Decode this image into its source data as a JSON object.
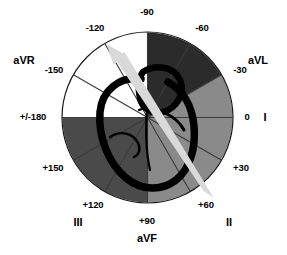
{
  "figure": {
    "type": "polar-diagram",
    "circle": {
      "cx": 147.5,
      "cy": 117.5,
      "r": 85
    },
    "colors": {
      "background": "#ffffff",
      "sector_white": "#ffffff",
      "sector_mid_gray": "#8a8a8a",
      "sector_dark_gray": "#4a4a4a",
      "sector_darkest": "#2b2b2b",
      "outline": "#000000",
      "heart_outline": "#000000",
      "arrow": "#d9d9d9",
      "spoke": "#3a3a3a"
    },
    "sectors": [
      {
        "name": "sector--90-to--60",
        "start_deg": -90,
        "end_deg": -60,
        "fill": "#2b2b2b"
      },
      {
        "name": "sector--60-to--30",
        "start_deg": -60,
        "end_deg": -30,
        "fill": "#2b2b2b"
      },
      {
        "name": "sector--30-to-0",
        "start_deg": -30,
        "end_deg": 0,
        "fill": "#8a8a8a"
      },
      {
        "name": "sector-0-to-30",
        "start_deg": 0,
        "end_deg": 30,
        "fill": "#8a8a8a"
      },
      {
        "name": "sector-30-to-60",
        "start_deg": 30,
        "end_deg": 60,
        "fill": "#8a8a8a"
      },
      {
        "name": "sector-60-to-90",
        "start_deg": 60,
        "end_deg": 90,
        "fill": "#8a8a8a"
      },
      {
        "name": "sector-90-to-120",
        "start_deg": 90,
        "end_deg": 120,
        "fill": "#4a4a4a"
      },
      {
        "name": "sector-120-to-150",
        "start_deg": 120,
        "end_deg": 150,
        "fill": "#4a4a4a"
      },
      {
        "name": "sector-150-to-180",
        "start_deg": 150,
        "end_deg": 180,
        "fill": "#4a4a4a"
      },
      {
        "name": "sector--180-to--150",
        "start_deg": 180,
        "end_deg": 210,
        "fill": "#ffffff"
      },
      {
        "name": "sector--150-to--120",
        "start_deg": 210,
        "end_deg": 240,
        "fill": "#ffffff"
      },
      {
        "name": "sector--120-to--90",
        "start_deg": 240,
        "end_deg": 270,
        "fill": "#ffffff"
      }
    ],
    "axis_labels": [
      {
        "id": "deg-minus-90",
        "text": "-90",
        "x": 147,
        "y": 12,
        "anchor": "center"
      },
      {
        "id": "deg-minus-120",
        "text": "-120",
        "x": 95,
        "y": 28,
        "anchor": "center"
      },
      {
        "id": "deg-minus-150",
        "text": "-150",
        "x": 54,
        "y": 70,
        "anchor": "center"
      },
      {
        "id": "deg-plus-minus-180",
        "text": "+/-180",
        "x": 33,
        "y": 117,
        "anchor": "center"
      },
      {
        "id": "deg-plus-150",
        "text": "+150",
        "x": 53,
        "y": 168,
        "anchor": "center"
      },
      {
        "id": "deg-plus-120",
        "text": "+120",
        "x": 93,
        "y": 205,
        "anchor": "center"
      },
      {
        "id": "deg-plus-90",
        "text": "+90",
        "x": 147,
        "y": 221,
        "anchor": "center"
      },
      {
        "id": "deg-plus-60",
        "text": "+60",
        "x": 206,
        "y": 205,
        "anchor": "center"
      },
      {
        "id": "deg-plus-30",
        "text": "+30",
        "x": 241,
        "y": 168,
        "anchor": "center"
      },
      {
        "id": "deg-zero",
        "text": "0",
        "x": 247,
        "y": 117,
        "anchor": "center"
      },
      {
        "id": "deg-minus-30",
        "text": "-30",
        "x": 240,
        "y": 70,
        "anchor": "center"
      },
      {
        "id": "deg-minus-60",
        "text": "-60",
        "x": 202,
        "y": 28,
        "anchor": "center"
      }
    ],
    "lead_labels": [
      {
        "id": "lead-aVR",
        "text": "aVR",
        "x": 24,
        "y": 60,
        "anchor": "center"
      },
      {
        "id": "lead-aVL",
        "text": "aVL",
        "x": 258,
        "y": 60,
        "anchor": "center"
      },
      {
        "id": "lead-I",
        "text": "I",
        "x": 265,
        "y": 117,
        "anchor": "center"
      },
      {
        "id": "lead-II",
        "text": "II",
        "x": 229,
        "y": 222,
        "anchor": "center"
      },
      {
        "id": "lead-III",
        "text": "III",
        "x": 78,
        "y": 222,
        "anchor": "center"
      },
      {
        "id": "lead-aVF",
        "text": "aVF",
        "x": 147,
        "y": 238,
        "anchor": "center"
      }
    ],
    "arrow": {
      "name": "electrical-axis-arrow",
      "from_deg": 60,
      "to_deg": -120,
      "tail_x": 213,
      "tail_y": 196,
      "tip_x": 107,
      "tip_y": 45,
      "color": "#d9d9d9"
    },
    "heart": {
      "name": "heart-outline",
      "stroke": "#000000",
      "stroke_width": 7
    }
  }
}
